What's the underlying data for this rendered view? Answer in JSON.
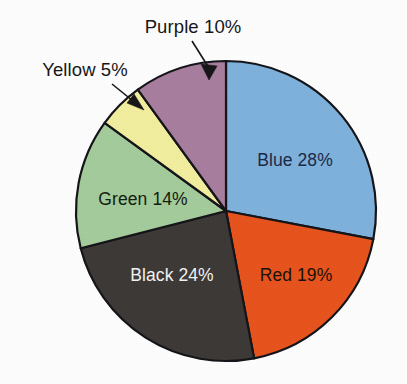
{
  "chart_data": {
    "type": "pie",
    "title": "",
    "subtitle": "",
    "xlabel": "",
    "ylabel": "",
    "legend_position": "none",
    "grid": false,
    "start_angle_deg": 0,
    "direction": "clockwise",
    "categories": [
      "Blue",
      "Red",
      "Black",
      "Green",
      "Yellow",
      "Purple"
    ],
    "values": [
      28,
      19,
      24,
      14,
      5,
      10
    ],
    "unit": "%",
    "slices": [
      {
        "name": "Blue",
        "value": 28,
        "label": "Blue 28%",
        "color": "#7fb2dc",
        "text_color": "#1c2a49",
        "label_placement": "inside"
      },
      {
        "name": "Red",
        "value": 19,
        "label": "Red 19%",
        "color": "#e8541e",
        "text_color": "#1a1208",
        "label_placement": "inside"
      },
      {
        "name": "Black",
        "value": 24,
        "label": "Black 24%",
        "color": "#3d3a38",
        "text_color": "#f4f4f2",
        "label_placement": "inside"
      },
      {
        "name": "Green",
        "value": 14,
        "label": "Green 14%",
        "color": "#a5cc9c",
        "text_color": "#14200f",
        "label_placement": "inside"
      },
      {
        "name": "Yellow",
        "value": 5,
        "label": "Yellow 5%",
        "color": "#f2efa0",
        "text_color": "#17171a",
        "label_placement": "outside-callout"
      },
      {
        "name": "Purple",
        "value": 10,
        "label": "Purple 10%",
        "color": "#a97fa0",
        "text_color": "#17171a",
        "label_placement": "outside-callout"
      }
    ]
  },
  "callouts": {
    "yellow": {
      "label": "Yellow 5%"
    },
    "purple": {
      "label": "Purple 10%"
    }
  },
  "colors": {
    "background": "#fefefe",
    "outline": "#15151a",
    "blue": "#7fb2dc",
    "red": "#e8541e",
    "black": "#3d3a38",
    "green": "#a5cc9c",
    "yellow": "#f2efa0",
    "purple": "#a97fa0"
  }
}
